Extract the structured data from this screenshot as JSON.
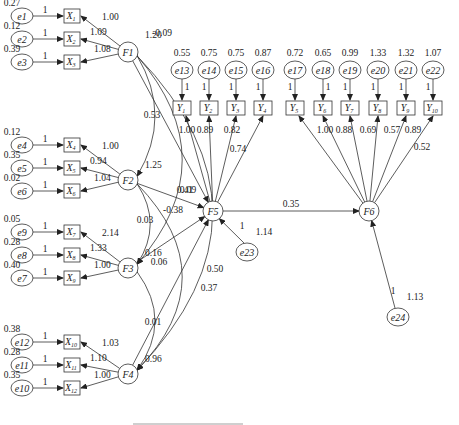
{
  "diagram": {
    "factors": [
      {
        "id": "F1",
        "variance": "1.20"
      },
      {
        "id": "F2",
        "variance": "1.25"
      },
      {
        "id": "F3",
        "variance": "0.16"
      },
      {
        "id": "F4",
        "variance": "0.96"
      },
      {
        "id": "F5"
      },
      {
        "id": "F6"
      }
    ],
    "x_indicators": [
      {
        "factor": "F1",
        "items": [
          {
            "label": "X",
            "sub": "1",
            "error": "e1",
            "error_var": "0.27",
            "fixed": "1",
            "loading": "1.00"
          },
          {
            "label": "X",
            "sub": "2",
            "error": "e2",
            "error_var": "0.12",
            "fixed": "1",
            "loading": "1.09"
          },
          {
            "label": "X",
            "sub": "3",
            "error": "e3",
            "error_var": "0.39",
            "fixed": "1",
            "loading": "1.08"
          }
        ]
      },
      {
        "factor": "F2",
        "items": [
          {
            "label": "X",
            "sub": "4",
            "error": "e4",
            "error_var": "0.12",
            "fixed": "1",
            "loading": "1.00"
          },
          {
            "label": "X",
            "sub": "5",
            "error": "e5",
            "error_var": "0.35",
            "fixed": "1",
            "loading": "0.94"
          },
          {
            "label": "X",
            "sub": "6",
            "error": "e6",
            "error_var": "0.02",
            "fixed": "1",
            "loading": "1.04"
          }
        ]
      },
      {
        "factor": "F3",
        "items": [
          {
            "label": "X",
            "sub": "7",
            "error": "e9",
            "error_var": "0.05",
            "fixed": "1",
            "loading": "2.14"
          },
          {
            "label": "X",
            "sub": "8",
            "error": "e8",
            "error_var": "0.28",
            "fixed": "1",
            "loading": "1.33"
          },
          {
            "label": "X",
            "sub": "9",
            "error": "e7",
            "error_var": "0.40",
            "fixed": "1",
            "loading": "1.00"
          }
        ]
      },
      {
        "factor": "F4",
        "items": [
          {
            "label": "X",
            "sub": "10",
            "error": "e12",
            "error_var": "0.38",
            "fixed": "1",
            "loading": "1.03"
          },
          {
            "label": "X",
            "sub": "11",
            "error": "e11",
            "error_var": "0.28",
            "fixed": "1",
            "loading": "1.10"
          },
          {
            "label": "X",
            "sub": "12",
            "error": "e10",
            "error_var": "0.35",
            "fixed": "1",
            "loading": "1.00"
          }
        ]
      }
    ],
    "y_indicators": [
      {
        "label": "Y",
        "sub": "1",
        "error": "e13",
        "error_var": "0.55",
        "fixed": "1",
        "factor": "F5",
        "loading": "1.00"
      },
      {
        "label": "Y",
        "sub": "2",
        "error": "e14",
        "error_var": "0.75",
        "fixed": "1",
        "factor": "F5",
        "loading": "0.89"
      },
      {
        "label": "Y",
        "sub": "3",
        "error": "e15",
        "error_var": "0.75",
        "fixed": "1",
        "factor": "F5",
        "loading": "0.82"
      },
      {
        "label": "Y",
        "sub": "4",
        "error": "e16",
        "error_var": "0.87",
        "fixed": "1",
        "factor": "F5",
        "loading": "0.74"
      },
      {
        "label": "Y",
        "sub": "5",
        "error": "e17",
        "error_var": "0.72",
        "fixed": "1",
        "factor": "F6",
        "loading": "1.00"
      },
      {
        "label": "Y",
        "sub": "6",
        "error": "e18",
        "error_var": "0.65",
        "fixed": "1",
        "factor": "F6",
        "loading": "0.88"
      },
      {
        "label": "Y",
        "sub": "7",
        "error": "e19",
        "error_var": "0.99",
        "fixed": "1",
        "factor": "F6",
        "loading": "0.69"
      },
      {
        "label": "Y",
        "sub": "8",
        "error": "e20",
        "error_var": "1.33",
        "fixed": "1",
        "factor": "F6",
        "loading": "0.57"
      },
      {
        "label": "Y",
        "sub": "9",
        "error": "e21",
        "error_var": "1.32",
        "fixed": "1",
        "factor": "F6",
        "loading": "0.89"
      },
      {
        "label": "Y",
        "sub": "10",
        "error": "e22",
        "error_var": "1.07",
        "fixed": "1",
        "factor": "F6",
        "loading": "0.52"
      }
    ],
    "disturbances": [
      {
        "id": "e23",
        "factor": "F5",
        "fixed": "1",
        "variance": "1.14"
      },
      {
        "id": "e24",
        "factor": "F6",
        "fixed": "1",
        "variance": "1.13"
      }
    ],
    "paths": [
      {
        "from": "F1",
        "to": "F5",
        "coef": "-0.09"
      },
      {
        "from": "F2",
        "to": "F5",
        "coef": "0.41"
      },
      {
        "from": "F3",
        "to": "F5",
        "coef": "-0.38"
      },
      {
        "from": "F4",
        "to": "F5",
        "coef": "0.37"
      },
      {
        "from": "F5",
        "to": "F6",
        "coef": "0.35"
      }
    ],
    "covariances": [
      {
        "a": "F1",
        "b": "F2",
        "value": "0.53"
      },
      {
        "a": "F1",
        "b": "F3",
        "value": "0.09"
      },
      {
        "a": "F1",
        "b": "F4",
        "value": "0.50"
      },
      {
        "a": "F2",
        "b": "F3",
        "value": "0.03"
      },
      {
        "a": "F2",
        "b": "F4",
        "value": "0.06"
      },
      {
        "a": "F3",
        "b": "F4",
        "value": "0.01"
      }
    ]
  }
}
